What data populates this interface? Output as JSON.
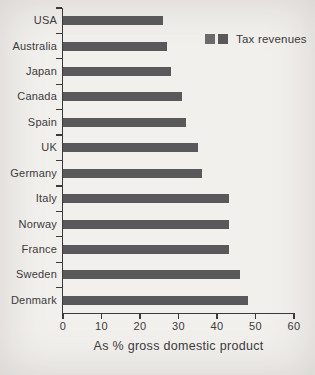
{
  "page": {
    "background": "#f2f0ed"
  },
  "chart_data": {
    "type": "bar",
    "orientation": "horizontal",
    "categories": [
      "USA",
      "Australia",
      "Japan",
      "Canada",
      "Spain",
      "UK",
      "Germany",
      "Italy",
      "Norway",
      "France",
      "Sweden",
      "Denmark"
    ],
    "values": [
      26,
      27,
      28,
      31,
      32,
      35,
      36,
      43,
      43,
      43,
      46,
      48
    ],
    "xlabel": "As % gross domestic product",
    "ylabel": "",
    "xlim": [
      0,
      60
    ],
    "x_ticks": [
      0,
      10,
      20,
      30,
      40,
      50,
      60
    ],
    "grid": false,
    "legend": {
      "label": "Tax revenues",
      "position": "top-right",
      "swatch_count": 2
    },
    "colors": {
      "bar": "#59585a",
      "axis": "#3a393b",
      "text": "#3b3a3c",
      "legend_swatch_1": "#6b6a6c",
      "legend_swatch_2": "#59585a"
    }
  }
}
